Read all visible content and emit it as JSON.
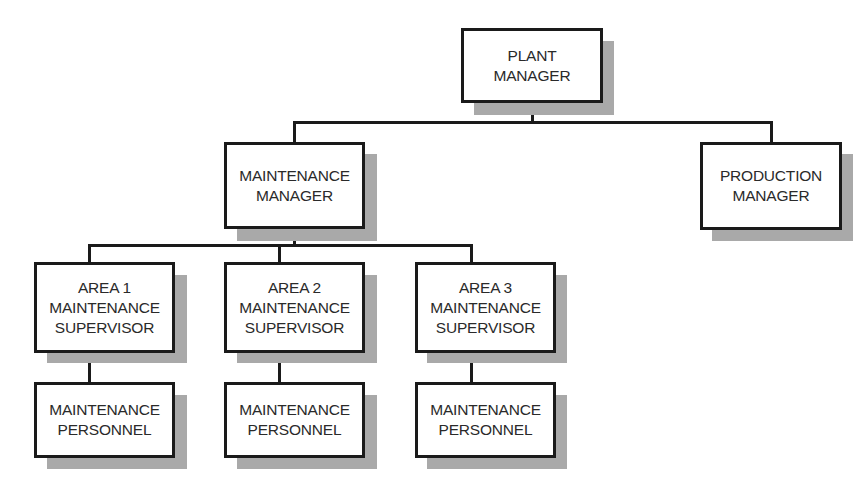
{
  "chart_title": "Maintenance organization chart",
  "nodes": {
    "plant_manager": {
      "lines": [
        "PLANT",
        "MANAGER"
      ]
    },
    "maintenance_manager": {
      "lines": [
        "MAINTENANCE",
        "MANAGER"
      ]
    },
    "production_manager": {
      "lines": [
        "PRODUCTION",
        "MANAGER"
      ]
    },
    "area1_supervisor": {
      "lines": [
        "AREA 1",
        "MAINTENANCE",
        "SUPERVISOR"
      ]
    },
    "area2_supervisor": {
      "lines": [
        "AREA 2",
        "MAINTENANCE",
        "SUPERVISOR"
      ]
    },
    "area3_supervisor": {
      "lines": [
        "AREA 3",
        "MAINTENANCE",
        "SUPERVISOR"
      ]
    },
    "area1_personnel": {
      "lines": [
        "MAINTENANCE",
        "PERSONNEL"
      ]
    },
    "area2_personnel": {
      "lines": [
        "MAINTENANCE",
        "PERSONNEL"
      ]
    },
    "area3_personnel": {
      "lines": [
        "MAINTENANCE",
        "PERSONNEL"
      ]
    }
  },
  "hierarchy": {
    "PLANT MANAGER": [
      "MAINTENANCE MANAGER",
      "PRODUCTION MANAGER"
    ],
    "MAINTENANCE MANAGER": [
      "AREA 1 MAINTENANCE SUPERVISOR",
      "AREA 2 MAINTENANCE SUPERVISOR",
      "AREA 3 MAINTENANCE SUPERVISOR"
    ],
    "AREA 1 MAINTENANCE SUPERVISOR": [
      "MAINTENANCE PERSONNEL"
    ],
    "AREA 2 MAINTENANCE SUPERVISOR": [
      "MAINTENANCE PERSONNEL"
    ],
    "AREA 3 MAINTENANCE SUPERVISOR": [
      "MAINTENANCE PERSONNEL"
    ]
  },
  "colors": {
    "box_border": "#1a1a1a",
    "shadow": "#a9a9a9",
    "text": "#2a2a2a",
    "background": "#ffffff"
  }
}
